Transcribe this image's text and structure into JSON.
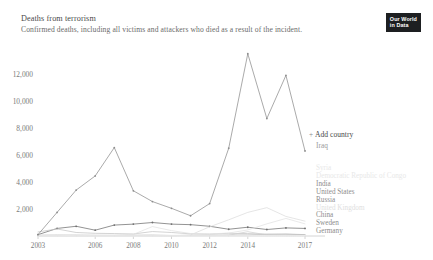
{
  "header": {
    "title": "Deaths from terrorism",
    "subtitle": "Confirmed deaths, including all victims and attackers who died as a result of the incident.",
    "logo_line1": "Our World",
    "logo_line2": "in Data"
  },
  "legend": {
    "add_country_label": "Add country",
    "add_icon": "plus-icon",
    "plus": "+",
    "selected": "Iraq",
    "items": [
      {
        "label": "Syria",
        "color": "#e8e8e8"
      },
      {
        "label": "Democratic Republic of Congo",
        "color": "#e8e8e8"
      },
      {
        "label": "India",
        "color": "#8d8d8d"
      },
      {
        "label": "United States",
        "color": "#8d8d8d"
      },
      {
        "label": "Russia",
        "color": "#8d8d8d"
      },
      {
        "label": "United Kingdom",
        "color": "#e0e0e0"
      },
      {
        "label": "China",
        "color": "#8d8d8d"
      },
      {
        "label": "Sweden",
        "color": "#8d8d8d"
      },
      {
        "label": "Germany",
        "color": "#8d8d8d"
      }
    ]
  },
  "chart_data": {
    "type": "line",
    "title": "Deaths from terrorism",
    "subtitle": "Confirmed deaths, including all victims and attackers who died as a result of the incident.",
    "xlabel": "",
    "ylabel": "",
    "xlim": [
      2003,
      2017
    ],
    "ylim": [
      0,
      13600
    ],
    "yticks": [
      2000,
      4000,
      6000,
      8000,
      10000,
      12000
    ],
    "ytick_labels": [
      "2,000",
      "4,000",
      "6,000",
      "8,000",
      "10,000",
      "12,000"
    ],
    "xticks": [
      2003,
      2006,
      2008,
      2010,
      2012,
      2014,
      2017
    ],
    "xtick_labels": [
      "2003",
      "2006",
      "2008",
      "2010",
      "2012",
      "2014",
      "2017"
    ],
    "grid": false,
    "legend_position": "right",
    "x": [
      2003,
      2004,
      2005,
      2006,
      2007,
      2008,
      2009,
      2010,
      2011,
      2012,
      2013,
      2014,
      2015,
      2016,
      2017
    ],
    "series": [
      {
        "name": "Iraq",
        "color": "#8d8d8d",
        "values": [
          100,
          1750,
          3400,
          4450,
          6550,
          3350,
          2550,
          2050,
          1500,
          2400,
          6500,
          13500,
          8700,
          11900,
          6300
        ]
      },
      {
        "name": "India",
        "color": "#6f6f6f",
        "values": [
          100,
          560,
          720,
          430,
          810,
          880,
          1000,
          880,
          840,
          720,
          500,
          650,
          480,
          600,
          560
        ]
      },
      {
        "name": "United States",
        "color": "#b9b9b9",
        "values": [
          60,
          70,
          60,
          50,
          50,
          60,
          70,
          40,
          50,
          60,
          70,
          80,
          120,
          150,
          100
        ]
      },
      {
        "name": "Russia",
        "color": "#c4c4c4",
        "values": [
          300,
          520,
          260,
          200,
          180,
          150,
          330,
          260,
          160,
          140,
          200,
          180,
          140,
          120,
          100
        ]
      },
      {
        "name": "Syria",
        "color": "#dcdcdc",
        "values": [
          0,
          0,
          0,
          0,
          0,
          0,
          0,
          0,
          80,
          680,
          1200,
          1750,
          2100,
          1450,
          1100
        ]
      },
      {
        "name": "Democratic Republic of Congo",
        "color": "#e2e2e2",
        "values": [
          40,
          60,
          80,
          60,
          50,
          120,
          700,
          400,
          180,
          150,
          220,
          450,
          900,
          1300,
          900
        ]
      },
      {
        "name": "China",
        "color": "#d0d0d0",
        "values": [
          10,
          10,
          20,
          10,
          10,
          40,
          20,
          20,
          30,
          20,
          60,
          320,
          80,
          40,
          30
        ]
      },
      {
        "name": "United Kingdom",
        "color": "#e6e6e6",
        "values": [
          10,
          10,
          60,
          10,
          10,
          10,
          10,
          10,
          10,
          10,
          10,
          10,
          10,
          10,
          40
        ]
      },
      {
        "name": "Sweden",
        "color": "#ececec",
        "values": [
          0,
          0,
          0,
          0,
          0,
          0,
          0,
          10,
          0,
          0,
          0,
          0,
          0,
          0,
          10
        ]
      },
      {
        "name": "Germany",
        "color": "#ececec",
        "values": [
          0,
          0,
          0,
          0,
          0,
          0,
          0,
          0,
          0,
          0,
          0,
          0,
          10,
          20,
          10
        ]
      }
    ]
  }
}
